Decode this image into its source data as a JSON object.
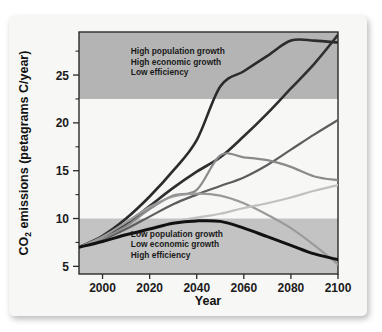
{
  "chart_data": {
    "type": "line",
    "title": "",
    "xlabel": "Year",
    "ylabel": "CO2 emissions (petagrams C/year)",
    "ylabel_parts": {
      "pre": "CO",
      "sub": "2",
      "post": " emissions (petagrams C/year)"
    },
    "xlim": [
      1990,
      2100
    ],
    "ylim": [
      4.2,
      29.5
    ],
    "xticks": [
      2000,
      2020,
      2040,
      2060,
      2080,
      2100
    ],
    "xtick_labels": [
      "2000",
      "2020",
      "2040",
      "2060",
      "2080",
      "2100"
    ],
    "yticks": [
      5,
      10,
      15,
      20,
      25
    ],
    "ytick_labels": [
      "5",
      "10",
      "15",
      "20",
      "25"
    ],
    "yticks_minor": [
      7.5,
      12.5,
      17.5,
      22.5,
      27.5
    ],
    "grid": false,
    "legend": "none",
    "bands": [
      {
        "name": "high-growth-band",
        "y0": 22.5,
        "y1": 29.5,
        "color": "#b4b4b4"
      },
      {
        "name": "low-growth-band",
        "y0": 4.2,
        "y1": 10.0,
        "color": "#c3c3c3"
      }
    ],
    "annotations": [
      {
        "name": "high-growth-annotation",
        "lines": [
          "High population growth",
          "High economic growth",
          "Low efficiency"
        ],
        "x": 2012,
        "y": 27.2
      },
      {
        "name": "low-growth-annotation",
        "lines": [
          "Low population growth",
          "Low economic growth",
          "High efficiency"
        ],
        "x": 2012,
        "y": 8.1
      }
    ],
    "series": [
      {
        "name": "scenario-a1-highest",
        "color": "#2b2b2b",
        "width": 2.6,
        "x": [
          1990,
          2000,
          2010,
          2020,
          2030,
          2040,
          2050,
          2060,
          2070,
          2080,
          2090,
          2100
        ],
        "values": [
          7.0,
          8.2,
          10.0,
          12.3,
          15.0,
          18.2,
          23.8,
          25.4,
          27.0,
          28.6,
          28.6,
          28.4
        ]
      },
      {
        "name": "scenario-a2-second",
        "color": "#2f2f2f",
        "width": 2.6,
        "x": [
          1990,
          2000,
          2010,
          2020,
          2030,
          2040,
          2050,
          2060,
          2070,
          2080,
          2090,
          2100
        ],
        "values": [
          7.0,
          8.0,
          9.4,
          11.3,
          13.2,
          14.9,
          16.4,
          18.6,
          21.0,
          23.6,
          26.2,
          29.2
        ]
      },
      {
        "name": "scenario-b2-rising-mid",
        "color": "#5d5d5d",
        "width": 2.2,
        "x": [
          1990,
          2000,
          2010,
          2020,
          2030,
          2040,
          2050,
          2060,
          2070,
          2080,
          2090,
          2100
        ],
        "values": [
          7.0,
          7.8,
          8.9,
          10.2,
          11.5,
          12.5,
          13.4,
          14.3,
          15.6,
          17.2,
          18.8,
          20.3
        ]
      },
      {
        "name": "scenario-peaked-mid",
        "color": "#8a8a8a",
        "width": 2.2,
        "x": [
          1990,
          2000,
          2010,
          2020,
          2030,
          2040,
          2050,
          2060,
          2070,
          2080,
          2090,
          2100
        ],
        "values": [
          7.0,
          7.9,
          9.2,
          11.0,
          12.4,
          13.0,
          16.6,
          16.4,
          16.1,
          15.4,
          14.4,
          14.0
        ]
      },
      {
        "name": "scenario-declining",
        "color": "#9a9a9a",
        "width": 2.2,
        "x": [
          1990,
          2000,
          2010,
          2020,
          2030,
          2040,
          2050,
          2060,
          2070,
          2080,
          2090,
          2100
        ],
        "values": [
          7.0,
          8.1,
          9.6,
          11.2,
          12.3,
          12.6,
          12.4,
          11.6,
          10.4,
          9.0,
          7.2,
          5.2
        ]
      },
      {
        "name": "scenario-low-flat",
        "color": "#c0c0c0",
        "width": 2.2,
        "x": [
          1990,
          2000,
          2010,
          2020,
          2030,
          2040,
          2050,
          2060,
          2070,
          2080,
          2090,
          2100
        ],
        "values": [
          7.0,
          7.6,
          8.3,
          9.1,
          9.7,
          10.1,
          10.5,
          11.1,
          11.6,
          12.2,
          12.9,
          13.5
        ]
      },
      {
        "name": "scenario-low-peak-black",
        "color": "#111111",
        "width": 3.0,
        "x": [
          1990,
          2000,
          2010,
          2020,
          2030,
          2040,
          2050,
          2060,
          2070,
          2080,
          2090,
          2100
        ],
        "values": [
          7.0,
          7.6,
          8.3,
          8.9,
          9.5,
          9.75,
          9.7,
          9.0,
          8.1,
          7.2,
          6.3,
          5.7
        ]
      }
    ]
  }
}
